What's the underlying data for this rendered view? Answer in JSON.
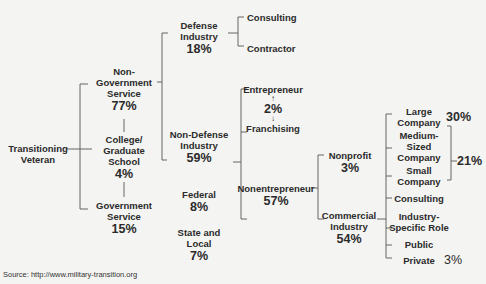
{
  "diagram": {
    "root": {
      "label": "Transitioning Veteran"
    },
    "level1": {
      "non_government": {
        "label_lines": [
          "Non-",
          "Government",
          "Service"
        ],
        "pct": "77%"
      },
      "college": {
        "label_lines": [
          "College/",
          "Graduate",
          "School"
        ],
        "pct": "4%"
      },
      "government": {
        "label_lines": [
          "Government",
          "Service"
        ],
        "pct": "15%"
      }
    },
    "non_government_children": {
      "defense": {
        "label_lines": [
          "Defense",
          "Industry"
        ],
        "pct": "18%",
        "children": [
          "Consulting",
          "Contractor"
        ]
      },
      "non_defense": {
        "label_lines": [
          "Non-Defense",
          "Industry"
        ],
        "pct": "59%"
      }
    },
    "government_children": {
      "federal": {
        "label_lines": [
          "Federal"
        ],
        "pct": "8%"
      },
      "state_local": {
        "label_lines": [
          "State and",
          "Local"
        ],
        "pct": "7%"
      }
    },
    "non_defense_children": {
      "entrepreneur": {
        "label": "Entrepreneur",
        "up_arrow": "↑",
        "pct": "2%",
        "down_arrow": "↓",
        "franchising": "Franchising"
      },
      "nonentrepreneur": {
        "label": "Nonentrepreneur",
        "pct": "57%"
      }
    },
    "nonentrepreneur_children": {
      "nonprofit": {
        "label_lines": [
          "Nonprofit"
        ],
        "pct": "3%"
      },
      "commercial": {
        "label_lines": [
          "Commercial",
          "Industry"
        ],
        "pct": "54%"
      }
    },
    "commercial_children": {
      "large": {
        "label_lines": [
          "Large",
          "Company"
        ],
        "pct": "30%"
      },
      "medium": {
        "label_lines": [
          "Medium-",
          "Sized",
          "Company"
        ]
      },
      "small": {
        "label_lines": [
          "Small",
          "Company"
        ]
      },
      "medium_small_pct": "21%",
      "consulting": {
        "label": "Consulting"
      },
      "industry_specific": {
        "label_lines": [
          "Industry-",
          "Specific Role"
        ]
      },
      "public": {
        "label": "Public"
      },
      "private": {
        "label": "Private",
        "pct": "3%"
      }
    }
  },
  "source": "Source: http://www.military-transition.org"
}
